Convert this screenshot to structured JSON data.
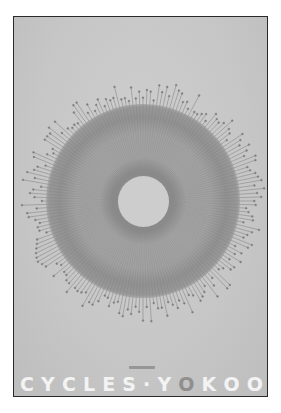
{
  "poster": {
    "background": "#c9c9c9",
    "border": "#2a2a2a",
    "title_letters": [
      "C",
      "Y",
      "C",
      "L",
      "E",
      "S",
      "·",
      "Y",
      "O",
      "K",
      "O",
      "O"
    ],
    "accent_letter_index": 8,
    "title_color": "#f3f3f3",
    "accent_color": "#8f8f8f"
  },
  "artwork": {
    "type": "radial-burst-disc",
    "center": [
      129,
      184
    ],
    "outer_ray_radius": 118,
    "disc_radius": 97,
    "hole_radius": 26,
    "ray_count": 180
  }
}
